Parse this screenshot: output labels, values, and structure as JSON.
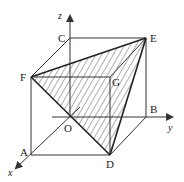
{
  "diagram": {
    "type": "cube-with-shaded-tetrahedron",
    "colors": {
      "line": "#333333",
      "hatch": "#333333",
      "background": "#ffffff"
    },
    "axes": {
      "x": "x",
      "y": "y",
      "z": "z"
    },
    "origin_label": "O",
    "vertices": {
      "A": "A",
      "B": "B",
      "C": "C",
      "D": "D",
      "E": "E",
      "F": "F",
      "G": "G"
    },
    "shaded_faces": [
      "FED",
      "FGE",
      "GED"
    ]
  }
}
